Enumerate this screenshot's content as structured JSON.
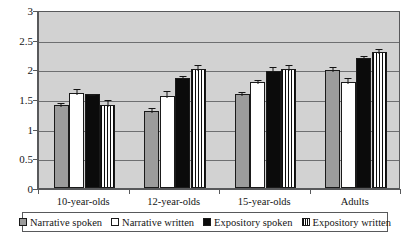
{
  "chart_data": {
    "type": "bar",
    "title": "",
    "subtitle": "",
    "xlabel": "",
    "ylabel": "",
    "ylim": [
      0,
      3
    ],
    "ytick_labels": [
      "0",
      "0.5",
      "1",
      "1.5",
      "2",
      "2.5",
      "3"
    ],
    "ytick_values": [
      0,
      0.5,
      1,
      1.5,
      2,
      2.5,
      3
    ],
    "grid": true,
    "grid_axis": "y",
    "legend_position": "bottom",
    "error_bars": "shown",
    "categories": [
      "10-year-olds",
      "12-year-olds",
      "15-year-olds",
      "Adults"
    ],
    "series": [
      {
        "name": "Narrative spoken",
        "swatch": "gray-filled-square",
        "color": "#9c9c9c",
        "values": [
          1.4,
          1.3,
          1.58,
          1.99
        ],
        "errors": [
          0.06,
          0.08,
          0.07,
          0.08
        ]
      },
      {
        "name": "Narrative written",
        "swatch": "white-open-square",
        "color": "#ffffff",
        "values": [
          1.6,
          1.55,
          1.78,
          1.79
        ],
        "errors": [
          0.1,
          0.12,
          0.07,
          0.1
        ]
      },
      {
        "name": "Expository spoken",
        "swatch": "black-filled-square",
        "color": "#0b0b0b",
        "values": [
          1.59,
          1.85,
          1.98,
          2.19
        ],
        "errors": [
          0.01,
          0.07,
          0.09,
          0.07
        ]
      },
      {
        "name": "Expository written",
        "swatch": "vertical-striped-square",
        "color": "#ffffff",
        "pattern": "vertical-stripes",
        "values": [
          1.4,
          2.0,
          2.0,
          2.29
        ],
        "errors": [
          0.12,
          0.1,
          0.11,
          0.09
        ]
      }
    ]
  },
  "legend": {
    "items": [
      {
        "label": "Narrative spoken"
      },
      {
        "label": "Narrative written"
      },
      {
        "label": "Expository spoken"
      },
      {
        "label": "Expository written"
      }
    ]
  }
}
